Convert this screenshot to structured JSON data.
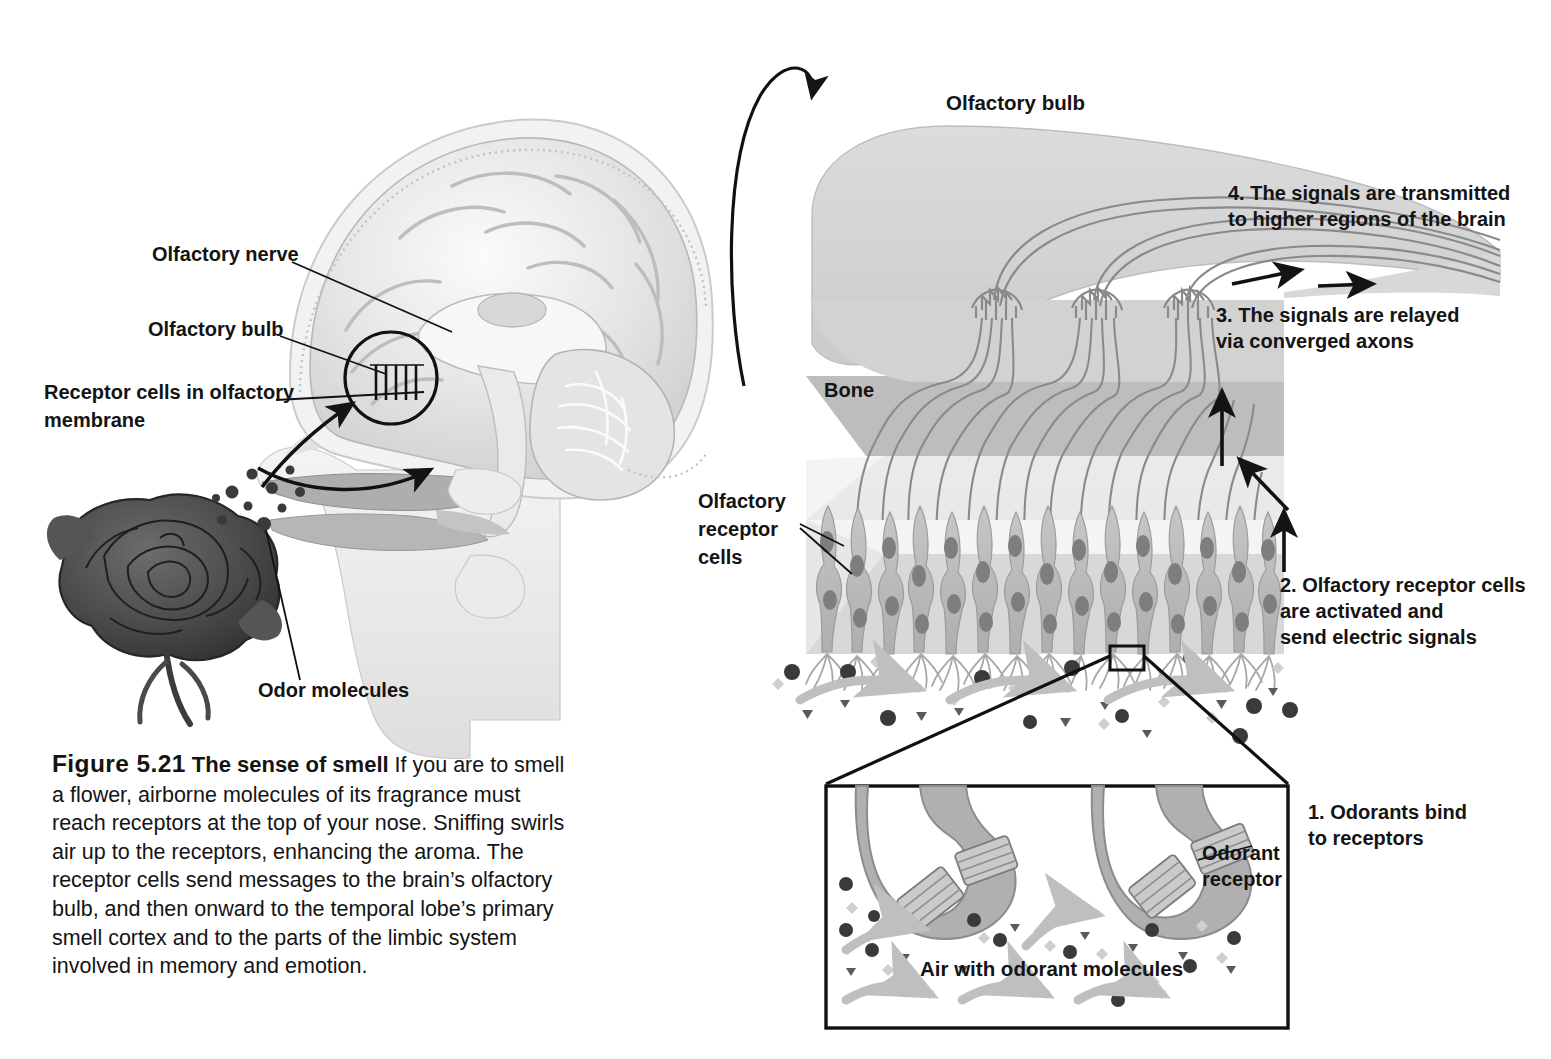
{
  "figure": {
    "number": "Figure 5.21",
    "title": "The sense of smell",
    "body": " If you are to smell a flower, airborne molecules of its fragrance must reach receptors at the top of your nose. Sniffing swirls air up to the receptors, enhancing the aroma. The receptor cells send messages to the brain’s olfactory bulb, and then onward to the temporal lobe’s primary smell cortex and to the parts of the limbic system involved in memory and emotion."
  },
  "left_panel": {
    "labels": {
      "olfactory_nerve": "Olfactory nerve",
      "olfactory_bulb": "Olfactory bulb",
      "receptor_cells_line1": "Receptor cells in olfactory",
      "receptor_cells_line2": "membrane",
      "odor_molecules": "Odor molecules"
    }
  },
  "right_panel": {
    "title": "Olfactory bulb",
    "bone_label": "Bone",
    "receptor_cells_label_lines": [
      "Olfactory",
      "receptor",
      "cells"
    ],
    "steps": [
      {
        "id": 1,
        "lines": [
          "1. Odorants bind",
          "to receptors"
        ]
      },
      {
        "id": 2,
        "lines": [
          "2. Olfactory receptor cells",
          "are activated and",
          "send electric signals"
        ]
      },
      {
        "id": 3,
        "lines": [
          "3. The signals are relayed",
          "via converged axons"
        ]
      },
      {
        "id": 4,
        "lines": [
          "4. The signals are transmitted",
          "to higher regions of the brain"
        ]
      }
    ]
  },
  "inset": {
    "odorant_receptor_lines": [
      "Odorant",
      "receptor"
    ],
    "air_label": "Air with odorant molecules"
  },
  "colors": {
    "ink": "#141414",
    "bulb_fill": "#d2d2d2",
    "bone_fill": "#bdbdbd",
    "epithelium_fill": "#d8d8d8",
    "mucus_fill": "#eeeeee",
    "cell_fill": "#b9b9b9",
    "nucleus_fill": "#7e7e7e",
    "axon_stroke": "#8a8a8a",
    "molecule_dark": "#3a3a3a",
    "molecule_light": "#cfcfcf",
    "swoosh": "#bfbfbf",
    "rose_dark": "#4a4a4a",
    "brain_light": "#e8e8e8"
  }
}
